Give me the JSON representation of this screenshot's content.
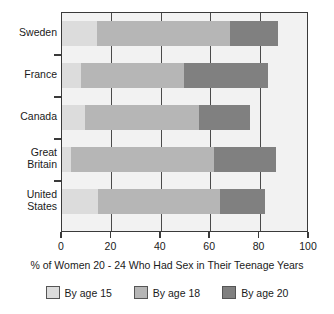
{
  "chart_data": {
    "type": "bar",
    "orientation": "horizontal",
    "stacked": true,
    "title": "",
    "xlabel": "% of Women 20 - 24 Who Had Sex in Their Teenage Years",
    "ylabel": "",
    "categories": [
      "Sweden",
      "France",
      "Canada",
      "Great\nBritain",
      "United\nStates"
    ],
    "xlim": [
      0,
      100
    ],
    "xticks": [
      0,
      20,
      40,
      60,
      80,
      100
    ],
    "xtick_labels": [
      "0",
      "20",
      "40",
      "60",
      "80",
      "100"
    ],
    "grid": true,
    "legend_position": "bottom",
    "series": [
      {
        "name": "By age 15",
        "color": "#dcdcdc",
        "values": [
          14,
          7.5,
          9.5,
          3.5,
          14.5
        ]
      },
      {
        "name": "By age 18",
        "color": "#b6b6b6",
        "values": [
          54,
          42,
          46,
          58,
          49.5
        ]
      },
      {
        "name": "By age 20",
        "color": "#808080",
        "values": [
          19.5,
          34,
          20.5,
          25,
          18
        ]
      }
    ],
    "cumulative_totals": [
      87.5,
      83.5,
      75.5,
      86.5,
      82
    ],
    "segment_boundaries": [
      {
        "category": "Sweden",
        "by_age_15": 14,
        "by_age_18": 68,
        "by_age_20": 87.5
      },
      {
        "category": "France",
        "by_age_15": 7.5,
        "by_age_18": 49.5,
        "by_age_20": 83.5
      },
      {
        "category": "Canada",
        "by_age_15": 9.5,
        "by_age_18": 55.5,
        "by_age_20": 75.5
      },
      {
        "category": "Great Britain",
        "by_age_15": 3.5,
        "by_age_18": 61.5,
        "by_age_20": 86.5
      },
      {
        "category": "United States",
        "by_age_15": 14.5,
        "by_age_18": 64,
        "by_age_20": 82
      }
    ]
  },
  "legend": {
    "entries": [
      {
        "label": "By age 15"
      },
      {
        "label": "By age 18"
      },
      {
        "label": "By age 20"
      }
    ]
  },
  "axis": {
    "title": "% of Women 20 - 24 Who Had Sex in Their Teenage Years"
  }
}
